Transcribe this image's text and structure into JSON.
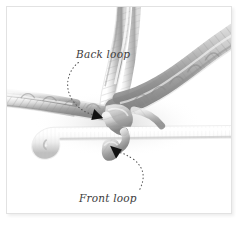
{
  "figure": {
    "background_color": "#ffffff",
    "border_color": "#e2e2e2"
  },
  "annotations": [
    {
      "id": "back-loop",
      "label": "Back loop",
      "arrow_color": "#1a1a1a",
      "leader_style": "dotted-curve",
      "arrow_direction": "down-right",
      "label_position": {
        "x": 69,
        "y": 41
      },
      "arrow_tip": {
        "x": 92,
        "y": 110
      }
    },
    {
      "id": "front-loop",
      "label": "Front loop",
      "arrow_color": "#1a1a1a",
      "leader_style": "dotted-curve",
      "arrow_direction": "up-left",
      "label_position": {
        "x": 72,
        "y": 185
      },
      "arrow_tip": {
        "x": 110,
        "y": 150
      }
    }
  ],
  "artwork": {
    "subject": "crochet-hook-and-yarn",
    "yarn_color_light": "#f2f2f2",
    "yarn_color_mid": "#c9c9c9",
    "yarn_color_dark": "#8d8d8d",
    "yarn_color_shadow": "#6b6b6b",
    "hook_color_light": "#fbfbfb",
    "hook_color_mid": "#e6e6e6",
    "hook_color_dark": "#c4c4c4",
    "elements": [
      "vertical-working-yarn",
      "left-horizontal-chain",
      "right-diagonal-chain",
      "crochet-hook",
      "center-stitch-junction"
    ]
  }
}
